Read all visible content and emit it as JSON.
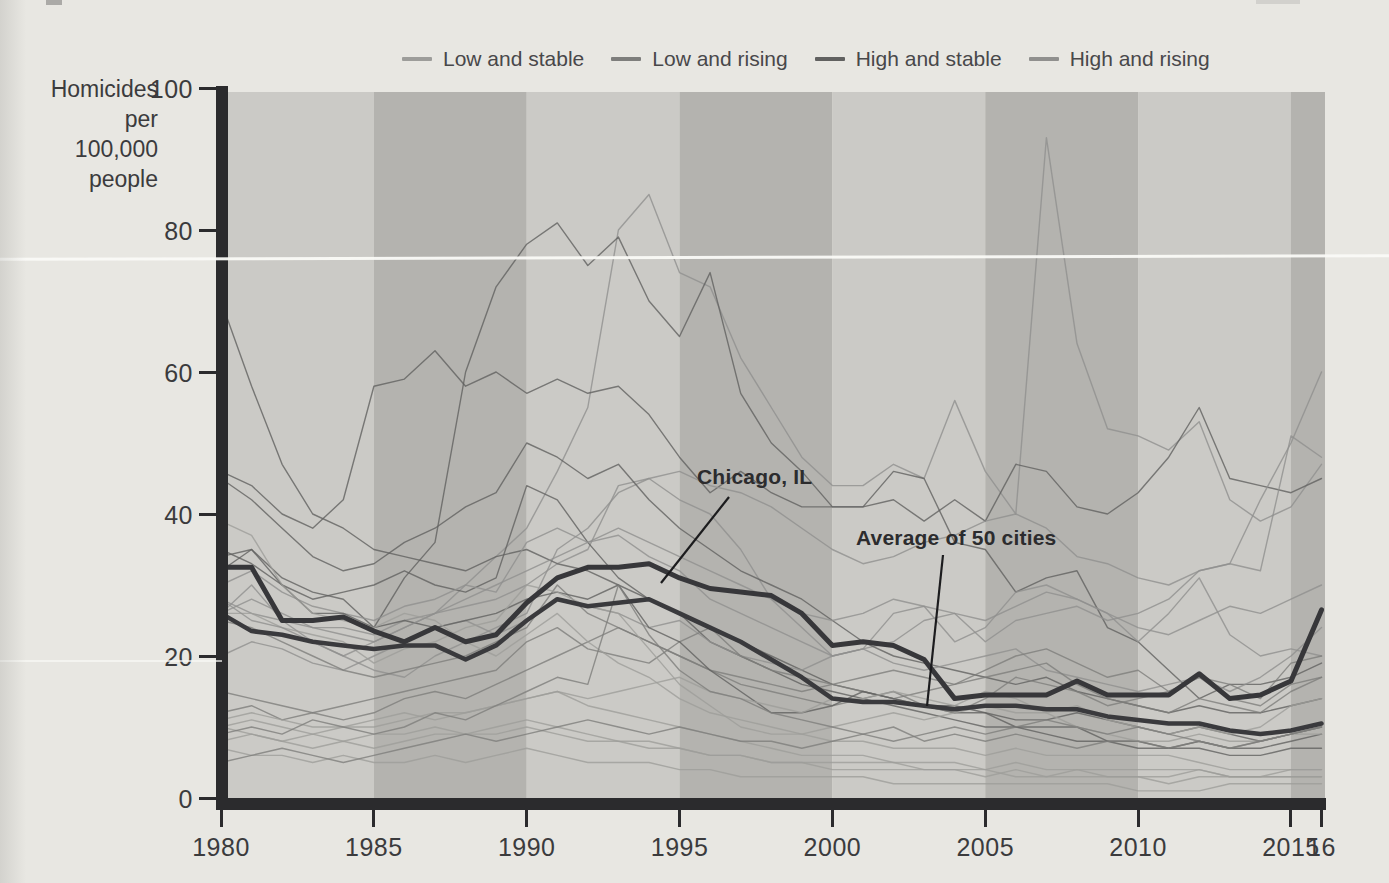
{
  "page": {
    "paper_color": "#e8e7e2"
  },
  "legend": {
    "items": [
      {
        "key": "low-stable",
        "label": "Low and stable",
        "color": "#9d9d9a"
      },
      {
        "key": "low-rising",
        "label": "Low and rising",
        "color": "#7e7e7c"
      },
      {
        "key": "high-stable",
        "label": "High and stable",
        "color": "#616160"
      },
      {
        "key": "high-rising",
        "label": "High and rising",
        "color": "#90908e"
      }
    ]
  },
  "y_axis": {
    "title_lines": [
      "Homicides",
      "per",
      "100,000",
      "people"
    ],
    "ticks": [
      "100",
      "80",
      "60",
      "40",
      "20",
      "0"
    ],
    "tick_values": [
      100,
      80,
      60,
      40,
      20,
      0
    ]
  },
  "x_axis": {
    "ticks": [
      "1980",
      "1985",
      "1990",
      "1995",
      "2000",
      "2005",
      "2010",
      "2015",
      "16"
    ],
    "tick_years": [
      1980,
      1985,
      1990,
      1995,
      2000,
      2005,
      2010,
      2015,
      2016
    ]
  },
  "annotations": [
    {
      "label": "Chicago, IL",
      "label_x": 697,
      "label_y": 465,
      "line": {
        "x1": 729,
        "y1": 497,
        "x2": 661,
        "y2": 583
      }
    },
    {
      "label": "Average of 50 cities",
      "label_x": 856,
      "label_y": 526,
      "line": {
        "x1": 943,
        "y1": 555,
        "x2": 927,
        "y2": 706
      }
    }
  ],
  "chart_data": {
    "type": "line",
    "ylabel": "Homicides per 100,000 people",
    "x_start": 1980,
    "x_end": 2016,
    "ylim": [
      0,
      100
    ],
    "grid": false,
    "legend_position": "top",
    "plot_bands": {
      "interval_years": 5,
      "light": "#cbcac6",
      "dark": "#b4b3af"
    },
    "highlight_series": [
      {
        "name": "Chicago, IL",
        "color": "#37373a",
        "width": 5,
        "values": [
          32.5,
          32.5,
          25,
          25,
          25.5,
          23.5,
          22,
          24,
          22,
          23,
          27.5,
          31,
          32.5,
          32.5,
          33,
          31,
          29.5,
          29,
          28.5,
          26,
          21.5,
          22,
          21.5,
          19.5,
          14,
          14.5,
          14.5,
          14.5,
          16.5,
          14.5,
          14.5,
          14.5,
          17.5,
          14,
          14.5,
          16.5,
          26.5
        ]
      },
      {
        "name": "Average of 50 cities",
        "color": "#3a3a3d",
        "width": 4.5,
        "values": [
          26,
          23.5,
          23,
          22,
          21.5,
          21,
          21.5,
          21.5,
          19.5,
          21.5,
          25,
          28,
          27,
          27.5,
          28,
          26,
          24,
          22,
          19.5,
          17,
          14,
          13.5,
          13.5,
          13,
          12.5,
          13,
          13,
          12.5,
          12.5,
          11.5,
          11,
          10.5,
          10.5,
          9.5,
          9,
          9.5,
          10.5
        ]
      }
    ],
    "background_series": [
      {
        "category": "high-rising",
        "values": [
          26,
          28,
          26,
          24,
          23,
          22,
          24,
          26,
          30,
          34,
          38,
          46,
          55,
          80,
          85,
          74,
          72,
          62,
          55,
          48,
          44,
          44,
          47,
          45,
          56,
          46,
          40,
          93,
          64,
          52,
          51,
          49,
          53,
          42,
          39,
          41,
          47
        ]
      },
      {
        "category": "high-stable",
        "values": [
          32,
          35,
          31,
          29,
          28,
          24,
          31,
          36,
          60,
          72,
          78,
          81,
          75,
          79,
          70,
          65,
          74,
          57,
          50,
          46,
          41,
          41,
          46,
          45,
          36,
          35,
          29,
          31,
          32,
          24,
          22,
          18,
          14,
          16,
          16,
          17,
          19
        ]
      },
      {
        "category": "high-stable",
        "values": [
          46,
          44,
          40,
          38,
          42,
          58,
          59,
          63,
          58,
          60,
          57,
          59,
          57,
          58,
          54,
          48,
          43,
          46,
          43,
          41,
          41,
          41,
          42,
          39,
          42,
          39,
          47,
          46,
          41,
          40,
          43,
          48,
          55,
          45,
          44,
          43,
          45
        ]
      },
      {
        "category": "high-rising",
        "values": [
          26,
          30,
          25,
          22,
          20,
          18,
          17,
          20,
          22,
          24,
          26,
          35,
          38,
          43,
          45,
          42,
          40,
          35,
          28,
          24,
          20,
          21,
          22,
          25,
          26,
          22,
          25,
          26,
          27,
          25,
          26,
          28,
          32,
          33,
          42,
          50,
          60
        ]
      },
      {
        "category": "high-rising",
        "values": [
          28,
          26,
          25,
          24,
          24,
          23,
          25,
          26,
          27,
          28,
          30,
          33,
          35,
          44,
          45,
          46,
          44,
          43,
          41,
          38,
          35,
          33,
          34,
          36,
          37,
          39,
          40,
          38,
          34,
          33,
          31,
          30,
          32,
          33,
          32,
          51,
          48
        ]
      },
      {
        "category": "high-stable",
        "values": [
          45,
          42,
          38,
          34,
          32,
          33,
          36,
          38,
          41,
          43,
          50,
          48,
          45,
          47,
          42,
          38,
          35,
          32,
          30,
          28,
          25,
          22,
          20,
          19,
          18,
          17,
          16,
          17,
          15,
          14,
          13,
          12,
          13,
          12,
          12,
          13,
          14
        ]
      },
      {
        "category": "high-stable",
        "values": [
          70,
          58,
          47,
          40,
          38,
          35,
          34,
          33,
          32,
          34,
          35,
          33,
          32,
          30,
          28,
          26,
          24,
          22,
          20,
          18,
          16,
          15,
          14,
          13,
          12,
          12,
          11,
          11,
          12,
          11,
          10,
          9,
          10,
          9,
          8,
          9,
          10
        ]
      },
      {
        "category": "high-stable",
        "values": [
          35,
          33,
          30,
          28,
          29,
          30,
          32,
          30,
          29,
          31,
          44,
          42,
          36,
          31,
          28,
          26,
          22,
          20,
          18,
          16,
          15,
          14,
          13,
          12,
          11,
          10,
          10,
          9,
          8,
          8,
          7,
          7,
          8,
          7,
          7,
          8,
          9
        ]
      },
      {
        "category": "high-rising",
        "values": [
          30,
          32,
          29,
          27,
          26,
          25,
          27,
          28,
          30,
          29,
          36,
          38,
          36,
          37,
          34,
          32,
          28,
          26,
          24,
          22,
          20,
          21,
          26,
          27,
          22,
          24,
          29,
          30,
          28,
          26,
          22,
          26,
          31,
          23,
          20,
          21,
          20
        ]
      },
      {
        "category": "high-rising",
        "values": [
          20,
          22,
          21,
          19,
          18,
          20,
          22,
          24,
          25,
          23,
          25,
          28,
          27,
          26,
          24,
          25,
          22,
          20,
          19,
          18,
          20,
          21,
          19,
          18,
          19,
          20,
          21,
          18,
          17,
          16,
          15,
          16,
          17,
          15,
          17,
          20,
          24
        ]
      },
      {
        "category": "low-rising",
        "values": [
          25,
          24,
          22,
          20,
          18,
          17,
          18,
          19,
          20,
          22,
          24,
          30,
          26,
          24,
          22,
          20,
          18,
          17,
          16,
          15,
          16,
          17,
          18,
          17,
          16,
          18,
          20,
          21,
          19,
          17,
          18,
          15,
          17,
          14,
          13,
          16,
          17
        ]
      },
      {
        "category": "low-rising",
        "values": [
          15,
          14,
          13,
          12,
          13,
          14,
          15,
          16,
          17,
          18,
          22,
          24,
          21,
          20,
          19,
          22,
          24,
          20,
          18,
          17,
          16,
          15,
          14,
          15,
          16,
          17,
          18,
          19,
          16,
          14,
          13,
          12,
          14,
          13,
          12,
          15,
          17
        ]
      },
      {
        "category": "low-rising",
        "values": [
          12,
          13,
          11,
          12,
          11,
          12,
          14,
          15,
          14,
          16,
          18,
          20,
          22,
          24,
          22,
          20,
          18,
          16,
          15,
          14,
          13,
          14,
          15,
          13,
          12,
          14,
          17,
          16,
          15,
          13,
          14,
          15,
          17,
          16,
          14,
          19,
          20
        ]
      },
      {
        "category": "high-stable",
        "values": [
          34,
          35,
          30,
          26,
          26,
          24,
          25,
          24,
          25,
          26,
          28,
          29,
          28,
          30,
          24,
          22,
          18,
          15,
          12,
          12,
          13,
          15,
          14,
          13,
          13,
          12,
          10,
          10,
          10,
          8,
          8,
          7,
          7,
          6,
          6,
          7,
          7
        ]
      },
      {
        "category": "low-stable",
        "values": [
          26,
          26,
          24,
          23,
          22,
          19,
          21,
          22,
          24,
          25,
          30,
          29,
          27,
          26,
          21,
          16,
          13,
          10,
          9,
          9,
          8,
          8,
          7,
          7,
          7,
          6,
          7,
          6,
          6,
          6,
          6,
          6,
          5,
          4,
          4,
          4,
          4
        ]
      },
      {
        "category": "low-stable",
        "values": [
          39,
          37,
          30,
          26,
          25,
          24,
          26,
          25,
          22,
          20,
          23,
          26,
          22,
          19,
          17,
          14,
          12,
          11,
          10,
          9,
          10,
          11,
          12,
          11,
          12,
          13,
          12,
          12,
          13,
          11,
          10,
          9,
          10,
          9,
          10,
          13,
          14
        ]
      },
      {
        "category": "low-stable",
        "values": [
          10,
          11,
          10,
          9,
          10,
          11,
          12,
          11,
          12,
          13,
          14,
          15,
          14,
          15,
          16,
          17,
          15,
          14,
          13,
          12,
          14,
          14,
          15,
          14,
          13,
          15,
          14,
          12,
          10,
          9,
          8,
          8,
          9,
          8,
          8,
          9,
          9
        ]
      },
      {
        "category": "low-stable",
        "values": [
          11,
          12,
          11,
          10,
          10,
          10,
          11,
          12,
          12,
          13,
          14,
          15,
          13,
          12,
          11,
          10,
          9,
          8,
          7,
          6,
          6,
          6,
          5,
          5,
          5,
          4,
          5,
          4,
          4,
          4,
          4,
          4,
          4,
          3,
          3,
          4,
          4
        ]
      },
      {
        "category": "low-stable",
        "values": [
          10,
          9,
          8,
          9,
          8,
          9,
          9,
          10,
          9,
          10,
          11,
          10,
          9,
          8,
          8,
          7,
          6,
          6,
          5,
          5,
          5,
          5,
          5,
          4,
          4,
          4,
          3,
          3,
          4,
          3,
          3,
          3,
          4,
          3,
          3,
          3,
          3
        ]
      },
      {
        "category": "low-stable",
        "values": [
          8,
          9,
          8,
          7,
          8,
          7,
          8,
          9,
          9,
          9,
          10,
          9,
          8,
          8,
          7,
          7,
          6,
          6,
          5,
          5,
          4,
          4,
          4,
          4,
          4,
          3,
          4,
          3,
          3,
          3,
          3,
          2,
          3,
          3,
          3,
          3,
          3
        ]
      },
      {
        "category": "low-stable",
        "values": [
          7,
          6,
          6,
          5,
          6,
          5,
          5,
          6,
          5,
          6,
          7,
          6,
          5,
          5,
          5,
          4,
          4,
          3,
          3,
          3,
          3,
          3,
          2,
          2,
          2,
          2,
          2,
          2,
          2,
          2,
          1,
          1,
          1,
          2,
          2,
          2,
          2
        ]
      },
      {
        "category": "low-rising",
        "values": [
          5,
          6,
          7,
          6,
          5,
          6,
          7,
          8,
          9,
          8,
          9,
          10,
          11,
          10,
          9,
          10,
          9,
          8,
          8,
          7,
          8,
          9,
          8,
          9,
          10,
          9,
          10,
          11,
          10,
          9,
          10,
          9,
          8,
          7,
          8,
          9,
          10
        ]
      },
      {
        "category": "low-rising",
        "values": [
          9,
          10,
          9,
          11,
          10,
          9,
          10,
          12,
          11,
          13,
          15,
          17,
          16,
          30,
          23,
          18,
          15,
          14,
          12,
          11,
          10,
          9,
          10,
          8,
          9,
          8,
          9,
          8,
          7,
          8,
          8,
          7,
          8,
          7,
          8,
          9,
          10
        ]
      },
      {
        "category": "high-rising",
        "values": [
          28,
          25,
          24,
          22,
          20,
          22,
          24,
          26,
          28,
          30,
          32,
          34,
          36,
          38,
          36,
          34,
          32,
          30,
          28,
          26,
          25,
          26,
          28,
          27,
          26,
          25,
          27,
          29,
          28,
          26,
          24,
          23,
          25,
          27,
          26,
          28,
          30
        ]
      }
    ]
  }
}
